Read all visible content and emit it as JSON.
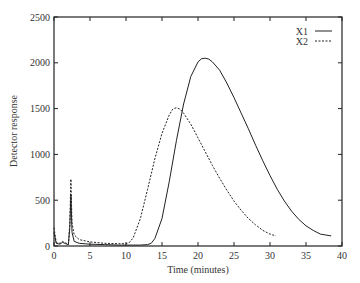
{
  "chart_data": {
    "type": "line",
    "title": "",
    "xlabel": "Time (minutes)",
    "ylabel": "Detector response",
    "xlim": [
      0,
      40
    ],
    "ylim": [
      0,
      2500
    ],
    "xticks": [
      0,
      5,
      10,
      15,
      20,
      25,
      30,
      35,
      40
    ],
    "yticks": [
      0,
      500,
      1000,
      1500,
      2000,
      2500
    ],
    "grid": false,
    "legend_position": "top-right",
    "series": [
      {
        "name": "X1",
        "style": "solid",
        "color": "#222222",
        "x": [
          0,
          0.3,
          0.8,
          1.2,
          1.6,
          2.0,
          2.2,
          2.35,
          2.5,
          2.8,
          3.5,
          5,
          7,
          9,
          11,
          12,
          13,
          13.5,
          14,
          15,
          16,
          17,
          18,
          19,
          20,
          20.5,
          21,
          21.5,
          22,
          23,
          24,
          25,
          26,
          27,
          28,
          29,
          30,
          31,
          32,
          33,
          34,
          35,
          36,
          37,
          38.5
        ],
        "y": [
          150,
          30,
          20,
          40,
          25,
          15,
          200,
          560,
          150,
          50,
          30,
          20,
          15,
          10,
          10,
          10,
          15,
          30,
          80,
          300,
          700,
          1150,
          1550,
          1850,
          2010,
          2045,
          2050,
          2040,
          2010,
          1920,
          1780,
          1620,
          1450,
          1280,
          1100,
          930,
          770,
          620,
          490,
          380,
          290,
          220,
          170,
          130,
          110
        ]
      },
      {
        "name": "X2",
        "style": "dashed",
        "color": "#222222",
        "x": [
          0,
          0.3,
          0.8,
          1.2,
          1.6,
          2.0,
          2.2,
          2.35,
          2.5,
          2.8,
          3.5,
          5,
          7,
          9,
          10,
          10.5,
          11,
          12,
          13,
          14,
          15,
          16,
          16.5,
          17,
          17.5,
          18,
          19,
          20,
          21,
          22,
          23,
          24,
          25,
          26,
          27,
          28,
          29,
          30,
          30.8
        ],
        "y": [
          200,
          40,
          30,
          50,
          35,
          20,
          250,
          730,
          250,
          120,
          70,
          45,
          30,
          25,
          25,
          40,
          90,
          300,
          620,
          950,
          1230,
          1430,
          1495,
          1510,
          1495,
          1450,
          1330,
          1180,
          1030,
          880,
          740,
          610,
          490,
          390,
          300,
          230,
          170,
          130,
          110
        ]
      }
    ]
  },
  "legend": {
    "items": [
      {
        "label": "X1",
        "style": "solid"
      },
      {
        "label": "X2",
        "style": "dashed"
      }
    ]
  },
  "colors": {
    "axis": "#222222",
    "line": "#222222",
    "background": "#ffffff"
  }
}
